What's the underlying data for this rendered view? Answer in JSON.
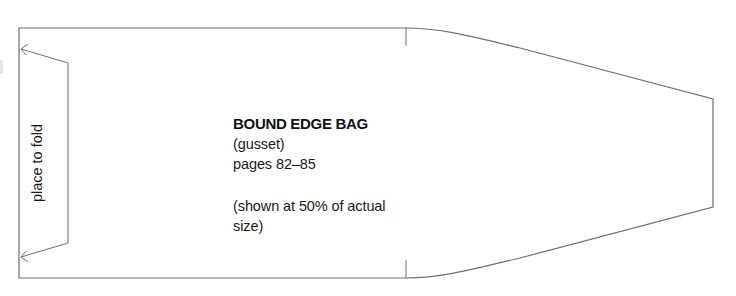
{
  "pattern": {
    "title": "BOUND EDGE BAG",
    "subtitle": "(gusset)",
    "pages": "pages 82–85",
    "scale_note_line1": "(shown at 50% of actual",
    "scale_note_line2": "size)",
    "fold_label": "place to fold",
    "colors": {
      "outline": "#6e6e6e",
      "text": "#1a1a1a",
      "background": "#ffffff"
    }
  }
}
